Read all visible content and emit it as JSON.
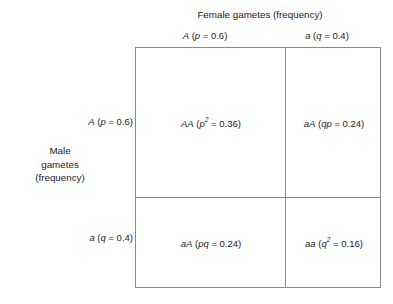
{
  "figure": {
    "title_columns": "Female gametes (frequency)",
    "title_rows_line1": "Male",
    "title_rows_line2": "gametes",
    "title_rows_line3": "(frequency)"
  },
  "columns": [
    {
      "allele": "A",
      "variable": "p",
      "frequency": "0.6",
      "header": "A (p = 0.6)"
    },
    {
      "allele": "a",
      "variable": "q",
      "frequency": "0.4",
      "header": "a (q = 0.4)"
    }
  ],
  "rows": [
    {
      "allele": "A",
      "variable": "p",
      "frequency": "0.6",
      "header": "A (p = 0.6)"
    },
    {
      "allele": "a",
      "variable": "q",
      "frequency": "0.4",
      "header": "a (q = 0.4)"
    }
  ],
  "cells": [
    {
      "genotype": "AA",
      "expression": "p²",
      "expression_base": "p",
      "expression_exponent": "2",
      "value": "0.36",
      "text": "AA (p² = 0.36)"
    },
    {
      "genotype": "aA",
      "expression": "qp",
      "expression_base": "qp",
      "expression_exponent": "",
      "value": "0.24",
      "text": "aA (qp = 0.24)"
    },
    {
      "genotype": "aA",
      "expression": "pq",
      "expression_base": "pq",
      "expression_exponent": "",
      "value": "0.24",
      "text": "aA (pq = 0.24)"
    },
    {
      "genotype": "aa",
      "expression": "q²",
      "expression_base": "q",
      "expression_exponent": "2",
      "value": "0.16",
      "text": "aa (q² = 0.16)"
    }
  ],
  "symbols": {
    "equals": "=",
    "paren_open": "(",
    "paren_close": ")"
  },
  "colors": {
    "background": "#ffffff",
    "text": "#1a1a1a",
    "grid_line": "#8a8a8a"
  }
}
